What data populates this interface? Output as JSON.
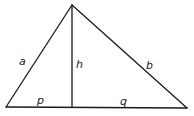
{
  "diagram": {
    "type": "right-triangle-altitude",
    "vertices": {
      "apex": [
        72,
        5
      ],
      "left": [
        6,
        107
      ],
      "right": [
        187,
        108
      ],
      "foot": [
        72,
        107
      ]
    },
    "labels": {
      "a": {
        "text": "a",
        "x": 19,
        "y": 65
      },
      "h": {
        "text": "h",
        "x": 76,
        "y": 68
      },
      "b": {
        "text": "b",
        "x": 146,
        "y": 69
      },
      "p": {
        "text": "p",
        "x": 37,
        "y": 104
      },
      "q": {
        "text": "q",
        "x": 120,
        "y": 105
      }
    },
    "colors": {
      "stroke": "#1a1a1a",
      "background": "#ffffff"
    }
  }
}
